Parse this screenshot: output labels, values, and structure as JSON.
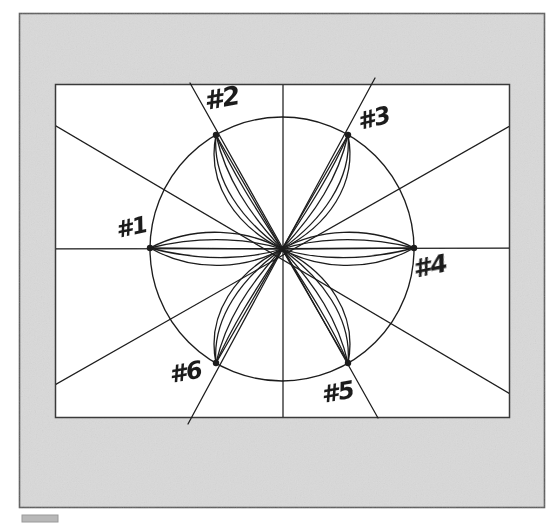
{
  "figure": {
    "media": "scanned hand-annotated technical drawing",
    "background_color": "#ffffff",
    "page_color": "#d9d9d9",
    "frame_color": "#5a5a5a",
    "ink_color": "#1c1c1c",
    "inner_panel_color": "#ffffff",
    "outer_frame": {
      "x": 19,
      "y": 13,
      "width": 526,
      "height": 495
    },
    "inner_panel": {
      "x": 55,
      "y": 84,
      "width": 455,
      "height": 334
    },
    "circle": {
      "cx": 282,
      "cy": 249,
      "r": 132
    },
    "corner_mark": {
      "x": 22,
      "y": 515,
      "width": 36,
      "height": 7,
      "color": "#9a9a9a"
    },
    "axes": [
      {
        "name": "horizontal-axis",
        "angle_deg": 0
      },
      {
        "name": "vertical-axis",
        "angle_deg": 90
      },
      {
        "name": "diagonal-axis-1-2-5",
        "angle_deg": 60
      },
      {
        "name": "diagonal-axis-3-6",
        "angle_deg": 120
      },
      {
        "name": "diagonal-axis-ne-sw",
        "angle_deg": 30
      },
      {
        "name": "diagonal-axis-nw-se",
        "angle_deg": 150
      }
    ],
    "points": [
      {
        "id": 1,
        "label": "#1",
        "angle_deg": 180,
        "label_x": 118,
        "label_y": 238,
        "rotate": -12
      },
      {
        "id": 2,
        "label": "#2",
        "angle_deg": 120,
        "label_x": 206,
        "label_y": 110,
        "rotate": -12
      },
      {
        "id": 3,
        "label": "#3",
        "angle_deg": 60,
        "label_x": 360,
        "label_y": 130,
        "rotate": -12
      },
      {
        "id": 4,
        "label": "#4",
        "angle_deg": 0,
        "label_x": 415,
        "label_y": 278,
        "rotate": -12
      },
      {
        "id": 5,
        "label": "#5",
        "angle_deg": 300,
        "label_x": 323,
        "label_y": 403,
        "rotate": -12
      },
      {
        "id": 6,
        "label": "#6",
        "angle_deg": 240,
        "label_x": 171,
        "label_y": 383,
        "rotate": -12
      }
    ],
    "petals": {
      "count": 6,
      "arcs_per_petal": 4,
      "description": "Each numbered point on the circle is joined to the centre by a straight chord plus nested curved arcs bulging to either side, forming lens-shaped petals."
    }
  }
}
